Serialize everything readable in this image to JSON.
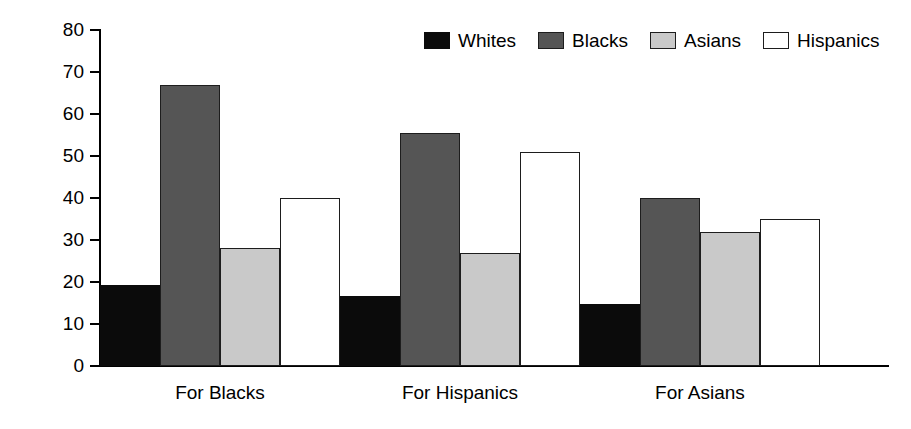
{
  "chart_data": {
    "type": "bar",
    "title": "",
    "subtitle": "",
    "xlabel": "",
    "ylabel": "",
    "ylim": [
      0,
      80
    ],
    "ytick_labels": [
      "80",
      "70",
      "60",
      "50",
      "40",
      "30",
      "20",
      "10",
      "0"
    ],
    "yticks": [
      80,
      70,
      60,
      50,
      40,
      30,
      20,
      10,
      0
    ],
    "grid": false,
    "legend_position": "top-right",
    "categories": [
      "For Blacks",
      "For Hispanics",
      "For Asians"
    ],
    "series": [
      {
        "name": "Whites",
        "color": "#0b0b0b",
        "values": [
          19.3,
          16.7,
          14.8
        ]
      },
      {
        "name": "Blacks",
        "color": "#555555",
        "values": [
          67.0,
          55.5,
          40.0
        ]
      },
      {
        "name": "Asians",
        "color": "#c9c9c9",
        "values": [
          28.0,
          27.0,
          32.0
        ]
      },
      {
        "name": "Hispanics",
        "color": "#ffffff",
        "values": [
          40.0,
          51.0,
          35.0
        ]
      }
    ]
  },
  "legend": {
    "items": [
      {
        "label": "Whites",
        "swatch": "whites"
      },
      {
        "label": "Blacks",
        "swatch": "blacks"
      },
      {
        "label": "Asians",
        "swatch": "asians"
      },
      {
        "label": "Hispanics",
        "swatch": "hispanics"
      }
    ]
  },
  "axes": {
    "y": {
      "min": 0,
      "max": 80,
      "step": 10
    }
  }
}
